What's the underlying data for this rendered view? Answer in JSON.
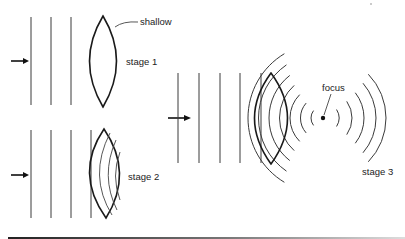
{
  "figure": {
    "labels": {
      "shallow": "shallow",
      "stage1": "stage 1",
      "stage2": "stage 2",
      "stage3": "stage 3",
      "focus": "focus"
    },
    "stages": [
      {
        "name": "stage 1",
        "incoming_wavefronts": 3,
        "lens_annotation": "shallow"
      },
      {
        "name": "stage 2",
        "incoming_wavefronts": 4,
        "wavefronts_inside_lens": 3
      },
      {
        "name": "stage 3",
        "incoming_wavefronts": 5,
        "converging_arcs": 7,
        "diverging_arcs": 5,
        "focal_point_label": "focus"
      }
    ],
    "colors": {
      "ink": "#1a1a1a",
      "background": "#ffffff"
    }
  }
}
